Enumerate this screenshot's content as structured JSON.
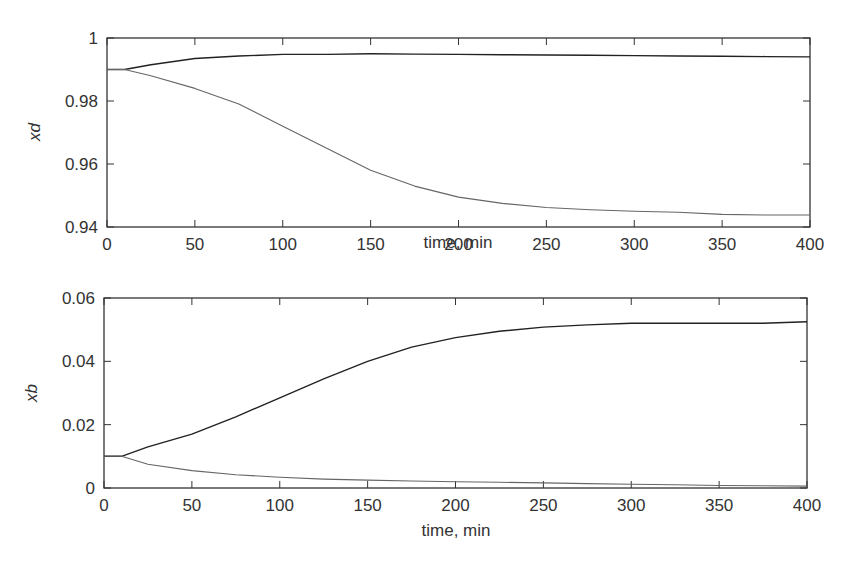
{
  "chart_data": [
    {
      "type": "line",
      "title": "",
      "xlabel": "time, min",
      "ylabel": "xd",
      "xlim": [
        0,
        400
      ],
      "ylim": [
        0.94,
        1.0
      ],
      "xticks": [
        "0",
        "50",
        "100",
        "150",
        "200",
        "250",
        "300",
        "350",
        "400"
      ],
      "yticks": [
        "0.94",
        "0.96",
        "0.98",
        "1"
      ],
      "grid": false,
      "legend": null,
      "x": [
        0,
        10,
        25,
        50,
        75,
        100,
        125,
        150,
        175,
        200,
        225,
        250,
        275,
        300,
        325,
        350,
        375,
        400
      ],
      "series": [
        {
          "name": "upper",
          "color": "#222222",
          "values": [
            0.99,
            0.99,
            0.9915,
            0.9935,
            0.9943,
            0.9948,
            0.9948,
            0.995,
            0.9949,
            0.9948,
            0.9947,
            0.9946,
            0.9945,
            0.9944,
            0.9943,
            0.9942,
            0.9941,
            0.994
          ]
        },
        {
          "name": "lower",
          "color": "#666666",
          "values": [
            0.99,
            0.99,
            0.988,
            0.984,
            0.979,
            0.972,
            0.965,
            0.958,
            0.953,
            0.9495,
            0.9475,
            0.9462,
            0.9455,
            0.945,
            0.9447,
            0.944,
            0.9438,
            0.9438
          ]
        }
      ]
    },
    {
      "type": "line",
      "title": "",
      "xlabel": "time, min",
      "ylabel": "xb",
      "xlim": [
        0,
        400
      ],
      "ylim": [
        0,
        0.06
      ],
      "xticks": [
        "0",
        "50",
        "100",
        "150",
        "200",
        "250",
        "300",
        "350",
        "400"
      ],
      "yticks": [
        "0",
        "0.02",
        "0.04",
        "0.06"
      ],
      "grid": false,
      "legend": null,
      "x": [
        0,
        10,
        25,
        50,
        75,
        100,
        125,
        150,
        175,
        200,
        225,
        250,
        275,
        300,
        325,
        350,
        375,
        400
      ],
      "series": [
        {
          "name": "upper",
          "color": "#222222",
          "values": [
            0.01,
            0.01,
            0.013,
            0.017,
            0.0225,
            0.0285,
            0.0345,
            0.04,
            0.0445,
            0.0475,
            0.0495,
            0.0508,
            0.0515,
            0.052,
            0.052,
            0.052,
            0.052,
            0.0525
          ]
        },
        {
          "name": "lower",
          "color": "#666666",
          "values": [
            0.01,
            0.01,
            0.0075,
            0.0055,
            0.0042,
            0.0034,
            0.0028,
            0.0025,
            0.0022,
            0.002,
            0.0018,
            0.0016,
            0.0014,
            0.0012,
            0.001,
            0.0008,
            0.0007,
            0.0006
          ]
        }
      ]
    }
  ],
  "plots": [
    {
      "xlabel": "time, min",
      "ylabel": "xd"
    },
    {
      "xlabel": "time, min",
      "ylabel": "xb"
    }
  ]
}
